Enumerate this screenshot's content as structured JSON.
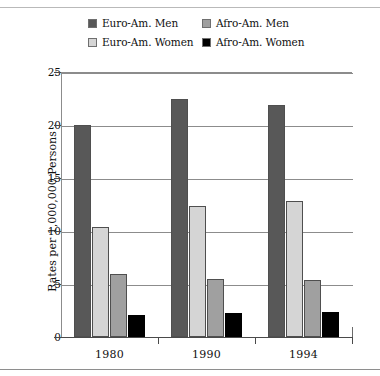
{
  "chart_data": {
    "type": "bar",
    "title": "",
    "subtitle": "",
    "xlabel": "",
    "ylabel": "Rates per 1,000,000 Persons",
    "categories": [
      "1980",
      "1990",
      "1994"
    ],
    "series": [
      {
        "name": "Euro-Am. Men",
        "color": "#585858",
        "values": [
          20.0,
          22.5,
          21.9
        ]
      },
      {
        "name": "Euro-Am. Women",
        "color": "#d5d5d5",
        "values": [
          10.4,
          12.4,
          12.8
        ]
      },
      {
        "name": "Afro-Am. Men",
        "color": "#a0a0a0",
        "values": [
          5.9,
          5.5,
          5.4
        ]
      },
      {
        "name": "Afro-Am. Women",
        "color": "#000000",
        "values": [
          2.1,
          2.3,
          2.4
        ]
      }
    ],
    "ylim": [
      0,
      25
    ],
    "yticks": [
      0,
      5,
      10,
      15,
      20,
      25
    ],
    "ytick_labels": [
      "0",
      "5",
      "10",
      "15",
      "20",
      "25"
    ],
    "grid": "horizontal",
    "legend_position": "top",
    "legend_order": [
      "Euro-Am. Men",
      "Afro-Am. Men",
      "Euro-Am. Women",
      "Afro-Am. Women"
    ]
  },
  "legend": {
    "items": [
      {
        "label": "Euro-Am. Men",
        "color": "#585858"
      },
      {
        "label": "Afro-Am. Men",
        "color": "#a0a0a0"
      },
      {
        "label": "Euro-Am. Women",
        "color": "#d5d5d5"
      },
      {
        "label": "Afro-Am. Women",
        "color": "#000000"
      }
    ]
  },
  "axes": {
    "y_title": "Rates per 1,000,000 Persons",
    "y_ticks": [
      "0",
      "5",
      "10",
      "15",
      "20",
      "25"
    ],
    "x_ticks": [
      "1980",
      "1990",
      "1994"
    ]
  }
}
